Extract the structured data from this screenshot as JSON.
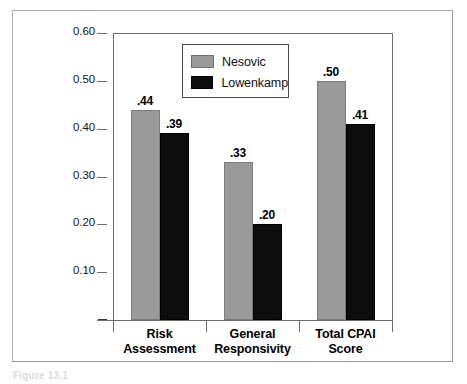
{
  "figure": {
    "caption": "Figure 13.1"
  },
  "chart_data": {
    "type": "bar",
    "title": "",
    "subtitle": "",
    "xlabel": "",
    "ylabel": "",
    "categories": [
      "Risk\nAssessment",
      "General\nResponsivity",
      "Total CPAI\nScore"
    ],
    "category_lines": [
      {
        "line1": "Risk",
        "line2": "Assessment"
      },
      {
        "line1": "General",
        "line2": "Responsivity"
      },
      {
        "line1": "Total CPAI",
        "line2": "Score"
      }
    ],
    "series": [
      {
        "name": "Nesovic",
        "color": "#9a9a9a",
        "values": [
          0.44,
          0.33,
          0.5
        ],
        "labels": [
          ".44",
          ".33",
          ".50"
        ]
      },
      {
        "name": "Lowenkamp",
        "color": "#0d0d0d",
        "values": [
          0.39,
          0.2,
          0.41
        ],
        "labels": [
          ".39",
          ".20",
          ".41"
        ]
      }
    ],
    "ylim": [
      0,
      0.6
    ],
    "ytick_values": [
      0.6,
      0.5,
      0.4,
      0.3,
      0.2,
      0.1,
      0
    ],
    "ytick_labels": [
      "0.60",
      "0.50",
      "0.40",
      "0.30",
      "0.20",
      "0.10",
      "–"
    ],
    "grid": false,
    "legend_position": "inside-top-left",
    "legend_entries": [
      "Nesovic",
      "Lowenkamp"
    ]
  }
}
